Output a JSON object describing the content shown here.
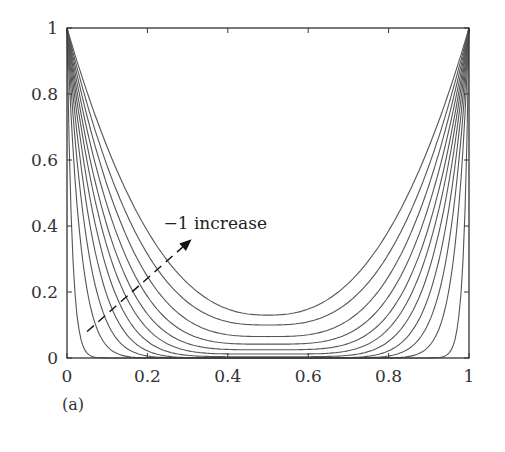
{
  "panel_label": "(a)",
  "chart_data": {
    "type": "line",
    "title": "",
    "xlabel": "",
    "ylabel": "",
    "xlim": [
      0,
      1
    ],
    "ylim": [
      0,
      1
    ],
    "grid": false,
    "legend": null,
    "x_ticks": [
      0,
      0.2,
      0.4,
      0.6,
      0.8,
      1
    ],
    "x_tick_labels": [
      "0",
      "0.2",
      "0.4",
      "0.6",
      "0.8",
      "1"
    ],
    "y_ticks": [
      0,
      0.2,
      0.4,
      0.6,
      0.8,
      1
    ],
    "y_tick_labels": [
      "0",
      "0.2",
      "0.4",
      "0.6",
      "0.8",
      "1"
    ],
    "annotation": {
      "text": "−1 increase",
      "arrow_from": [
        0.05,
        0.08
      ],
      "arrow_to": [
        0.31,
        0.36
      ],
      "text_pos": [
        0.24,
        0.39
      ],
      "style": "dashed-arrow"
    },
    "series_model": "y = min + (1 - min) * |2x - 1|^p  (symmetric U-shaped curves)",
    "x": [
      0,
      0.05,
      0.1,
      0.15,
      0.2,
      0.25,
      0.3,
      0.35,
      0.4,
      0.45,
      0.5,
      0.55,
      0.6,
      0.65,
      0.7,
      0.75,
      0.8,
      0.85,
      0.9,
      0.95,
      1
    ],
    "series": [
      {
        "name": "curve-1",
        "min": 0.13,
        "p": 2.4,
        "values": [
          1.0,
          0.79,
          0.63,
          0.5,
          0.38,
          0.3,
          0.23,
          0.18,
          0.15,
          0.13,
          0.13,
          0.13,
          0.15,
          0.18,
          0.23,
          0.3,
          0.38,
          0.5,
          0.63,
          0.79,
          1.0
        ]
      },
      {
        "name": "curve-2",
        "min": 0.1,
        "p": 2.8,
        "values": [
          1.0,
          0.77,
          0.59,
          0.45,
          0.33,
          0.24,
          0.18,
          0.13,
          0.11,
          0.1,
          0.1,
          0.1,
          0.11,
          0.13,
          0.18,
          0.24,
          0.33,
          0.45,
          0.59,
          0.77,
          1.0
        ]
      },
      {
        "name": "curve-3",
        "min": 0.065,
        "p": 3.2,
        "values": [
          1.0,
          0.75,
          0.55,
          0.4,
          0.28,
          0.19,
          0.13,
          0.09,
          0.07,
          0.065,
          0.065,
          0.065,
          0.07,
          0.09,
          0.13,
          0.19,
          0.28,
          0.4,
          0.55,
          0.75,
          1.0
        ]
      },
      {
        "name": "curve-4",
        "min": 0.042,
        "p": 3.7,
        "values": [
          1.0,
          0.73,
          0.52,
          0.36,
          0.23,
          0.15,
          0.09,
          0.06,
          0.045,
          0.042,
          0.042,
          0.042,
          0.045,
          0.06,
          0.09,
          0.15,
          0.23,
          0.36,
          0.52,
          0.73,
          1.0
        ]
      },
      {
        "name": "curve-5",
        "min": 0.025,
        "p": 4.3,
        "values": [
          1.0,
          0.71,
          0.48,
          0.31,
          0.19,
          0.11,
          0.06,
          0.035,
          0.027,
          0.025,
          0.025,
          0.025,
          0.027,
          0.035,
          0.06,
          0.11,
          0.19,
          0.31,
          0.48,
          0.71,
          1.0
        ]
      },
      {
        "name": "curve-6",
        "min": 0.012,
        "p": 5.0,
        "values": [
          1.0,
          0.68,
          0.44,
          0.27,
          0.15,
          0.08,
          0.04,
          0.02,
          0.013,
          0.012,
          0.012,
          0.012,
          0.013,
          0.02,
          0.04,
          0.08,
          0.15,
          0.27,
          0.44,
          0.68,
          1.0
        ]
      },
      {
        "name": "curve-7",
        "min": 0.004,
        "p": 6.0,
        "values": [
          1.0,
          0.64,
          0.38,
          0.21,
          0.11,
          0.05,
          0.02,
          0.008,
          0.005,
          0.004,
          0.004,
          0.004,
          0.005,
          0.008,
          0.02,
          0.05,
          0.11,
          0.21,
          0.38,
          0.64,
          1.0
        ]
      },
      {
        "name": "curve-8",
        "min": 0.0,
        "p": 7.5,
        "values": [
          1.0,
          0.57,
          0.31,
          0.15,
          0.06,
          0.02,
          0.007,
          0.001,
          0.0,
          0.0,
          0.0,
          0.0,
          0.0,
          0.001,
          0.007,
          0.02,
          0.06,
          0.15,
          0.31,
          0.57,
          1.0
        ]
      },
      {
        "name": "curve-9",
        "min": 0.0,
        "p": 10.0,
        "values": [
          1.0,
          0.49,
          0.21,
          0.08,
          0.02,
          0.005,
          0.0,
          0.0,
          0.0,
          0.0,
          0.0,
          0.0,
          0.0,
          0.0,
          0.0,
          0.005,
          0.02,
          0.08,
          0.21,
          0.49,
          1.0
        ]
      },
      {
        "name": "curve-10",
        "min": 0.0,
        "p": 15.0,
        "values": [
          1.0,
          0.36,
          0.11,
          0.02,
          0.005,
          0.0,
          0.0,
          0.0,
          0.0,
          0.0,
          0.0,
          0.0,
          0.0,
          0.0,
          0.0,
          0.0,
          0.005,
          0.02,
          0.11,
          0.36,
          1.0
        ]
      },
      {
        "name": "curve-11",
        "min": 0.0,
        "p": 40.0,
        "values": [
          1.0,
          0.07,
          0.0,
          0.0,
          0.0,
          0.0,
          0.0,
          0.0,
          0.0,
          0.0,
          0.0,
          0.0,
          0.0,
          0.0,
          0.0,
          0.0,
          0.0,
          0.0,
          0.0,
          0.07,
          1.0
        ]
      }
    ],
    "colors": {
      "line": "#555555",
      "axis": "#333333"
    }
  }
}
